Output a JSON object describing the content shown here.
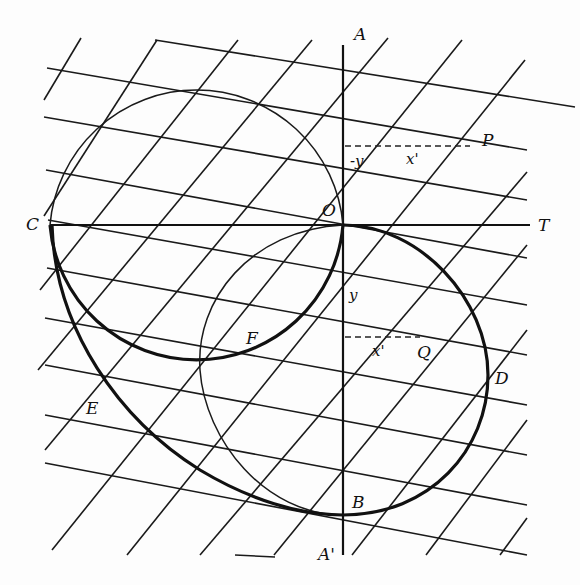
{
  "figure": {
    "type": "geometric construction on oblique coordinate grid",
    "labels": {
      "A": "A",
      "A_prime": "A'",
      "B": "B",
      "C": "C",
      "D": "D",
      "E": "E",
      "F": "F",
      "O": "O",
      "P": "P",
      "Q": "Q",
      "T": "T",
      "neg_y": "-y",
      "y": "y",
      "x_prime_upper": "x'",
      "x_prime_lower": "x'"
    },
    "colors": {
      "ink": "#111111",
      "paper": "#fdfdfd"
    }
  }
}
